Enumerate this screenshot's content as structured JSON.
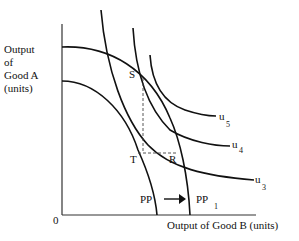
{
  "diagram": {
    "y_axis_label": [
      "Output",
      "of",
      "Good A",
      "(units)"
    ],
    "x_axis_label": "Output of Good B (units)",
    "origin_label": "0",
    "points": {
      "S": "S",
      "T": "T",
      "R": "R"
    },
    "curves": {
      "pp": {
        "label": "PP"
      },
      "pp1": {
        "label": "PP",
        "subscript": "1"
      },
      "u3": {
        "label": "u",
        "subscript": "3"
      },
      "u4": {
        "label": "u",
        "subscript": "4"
      },
      "u5": {
        "label": "u",
        "subscript": "5"
      }
    },
    "arrow": "shift-right"
  }
}
